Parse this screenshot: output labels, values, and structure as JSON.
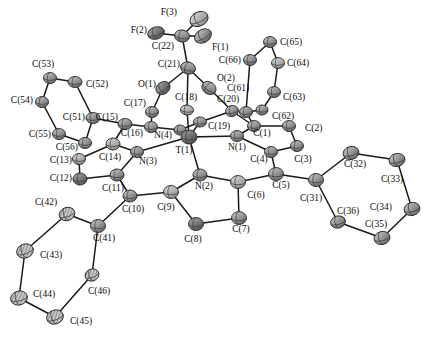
{
  "figure": {
    "kind": "ortep-thermal-ellipsoid-plot",
    "title": "",
    "background_color": "#ffffff",
    "bond_color": "#1a1a1a",
    "label_color": "#0d0d0d",
    "palette": {
      "carbon": "#8a8a8a",
      "carbon_dark": "#6e6e6e",
      "carbon_light": "#b4b4b4",
      "nitrogen": "#9c9c9c",
      "oxygen": "#7d7d7d",
      "fluorine": "#787878",
      "metal": "#6a6a6a",
      "outline": "#2a2a2a"
    }
  },
  "chart_data": {
    "type": "scatter",
    "title": "",
    "xlabel": "",
    "ylabel": "",
    "xlim": [
      0,
      439
    ],
    "ylim": [
      0,
      338
    ],
    "grid": false,
    "legend": "none",
    "atoms": [
      {
        "label": "F(3)",
        "element": "F",
        "x": 199,
        "y": 19,
        "rx": 9.5,
        "ry": 7.0,
        "rot": -25,
        "shade": "light",
        "lx": 177,
        "ly": 13,
        "anchor": "end"
      },
      {
        "label": "F(2)",
        "element": "F",
        "x": 156,
        "y": 33,
        "rx": 8.5,
        "ry": 6.0,
        "rot": -18,
        "shade": "dark",
        "lx": 147,
        "ly": 31,
        "anchor": "end"
      },
      {
        "label": "F(1)",
        "element": "F",
        "x": 203,
        "y": 36,
        "rx": 9.0,
        "ry": 6.5,
        "rot": -30,
        "shade": "mid",
        "lx": 212,
        "ly": 48,
        "anchor": "start"
      },
      {
        "label": "C(22)",
        "element": "C",
        "x": 182,
        "y": 36,
        "rx": 7.5,
        "ry": 6.0,
        "rot": 10,
        "shade": "mid",
        "lx": 174,
        "ly": 47,
        "anchor": "end"
      },
      {
        "label": "C(21)",
        "element": "C",
        "x": 188,
        "y": 68,
        "rx": 7.5,
        "ry": 6.0,
        "rot": 15,
        "shade": "mid",
        "lx": 180,
        "ly": 65,
        "anchor": "end"
      },
      {
        "label": "O(1)",
        "element": "O",
        "x": 163,
        "y": 88,
        "rx": 7.5,
        "ry": 6.0,
        "rot": -35,
        "shade": "dark",
        "lx": 156,
        "ly": 85,
        "anchor": "end"
      },
      {
        "label": "O(2)",
        "element": "O",
        "x": 209,
        "y": 88,
        "rx": 7.5,
        "ry": 6.0,
        "rot": 35,
        "shade": "mid",
        "lx": 217,
        "ly": 79,
        "anchor": "start"
      },
      {
        "label": "C(17)",
        "element": "C",
        "x": 152,
        "y": 112,
        "rx": 6.5,
        "ry": 5.5,
        "rot": 0,
        "shade": "mid",
        "lx": 146,
        "ly": 104,
        "anchor": "end"
      },
      {
        "label": "C(18)",
        "element": "C",
        "x": 187,
        "y": 110,
        "rx": 6.5,
        "ry": 5.0,
        "rot": 5,
        "shade": "light",
        "lx": 186,
        "ly": 98,
        "anchor": "middle"
      },
      {
        "label": "C(20)",
        "element": "C",
        "x": 232,
        "y": 111,
        "rx": 6.5,
        "ry": 5.5,
        "rot": -10,
        "shade": "mid",
        "lx": 228,
        "ly": 100,
        "anchor": "middle"
      },
      {
        "label": "C(16)",
        "element": "C",
        "x": 151,
        "y": 127,
        "rx": 6.5,
        "ry": 5.5,
        "rot": 0,
        "shade": "mid",
        "lx": 143,
        "ly": 134,
        "anchor": "end"
      },
      {
        "label": "C(19)",
        "element": "C",
        "x": 200,
        "y": 122,
        "rx": 6.5,
        "ry": 5.0,
        "rot": 0,
        "shade": "mid",
        "lx": 208,
        "ly": 127,
        "anchor": "start"
      },
      {
        "label": "N(4)",
        "element": "N",
        "x": 180,
        "y": 130,
        "rx": 6.0,
        "ry": 5.0,
        "rot": 0,
        "shade": "mid",
        "lx": 172,
        "ly": 136,
        "anchor": "end"
      },
      {
        "label": "T(1)",
        "element": "M",
        "x": 189,
        "y": 137,
        "rx": 8.0,
        "ry": 7.0,
        "rot": 0,
        "shade": "metal",
        "lx": 184,
        "ly": 151,
        "anchor": "middle"
      },
      {
        "label": "N(1)",
        "element": "N",
        "x": 237,
        "y": 136,
        "rx": 6.5,
        "ry": 5.5,
        "rot": 0,
        "shade": "mid",
        "lx": 228,
        "ly": 148,
        "anchor": "start"
      },
      {
        "label": "N(3)",
        "element": "N",
        "x": 137,
        "y": 152,
        "rx": 6.5,
        "ry": 5.5,
        "rot": 0,
        "shade": "mid",
        "lx": 148,
        "ly": 162,
        "anchor": "middle"
      },
      {
        "label": "N(2)",
        "element": "N",
        "x": 200,
        "y": 175,
        "rx": 7.0,
        "ry": 6.0,
        "rot": 0,
        "shade": "mid",
        "lx": 204,
        "ly": 187,
        "anchor": "middle"
      },
      {
        "label": "C(15)",
        "element": "C",
        "x": 125,
        "y": 124,
        "rx": 7.0,
        "ry": 5.5,
        "rot": 0,
        "shade": "mid",
        "lx": 118,
        "ly": 118,
        "anchor": "end"
      },
      {
        "label": "C(14)",
        "element": "C",
        "x": 113,
        "y": 144,
        "rx": 7.0,
        "ry": 6.0,
        "rot": 0,
        "shade": "light",
        "lx": 110,
        "ly": 158,
        "anchor": "middle"
      },
      {
        "label": "C(13)",
        "element": "C",
        "x": 79,
        "y": 159,
        "rx": 6.5,
        "ry": 5.5,
        "rot": 0,
        "shade": "light",
        "lx": 72,
        "ly": 161,
        "anchor": "end"
      },
      {
        "label": "C(12)",
        "element": "C",
        "x": 80,
        "y": 179,
        "rx": 7.0,
        "ry": 6.0,
        "rot": 0,
        "shade": "dark",
        "lx": 72,
        "ly": 179,
        "anchor": "end"
      },
      {
        "label": "C(11)",
        "element": "C",
        "x": 117,
        "y": 175,
        "rx": 7.0,
        "ry": 6.0,
        "rot": 0,
        "shade": "mid",
        "lx": 113,
        "ly": 189,
        "anchor": "middle"
      },
      {
        "label": "C(10)",
        "element": "C",
        "x": 130,
        "y": 196,
        "rx": 7.0,
        "ry": 6.0,
        "rot": 0,
        "shade": "mid",
        "lx": 133,
        "ly": 210,
        "anchor": "middle"
      },
      {
        "label": "C(9)",
        "element": "C",
        "x": 171,
        "y": 192,
        "rx": 7.5,
        "ry": 6.5,
        "rot": 0,
        "shade": "light",
        "lx": 166,
        "ly": 208,
        "anchor": "middle"
      },
      {
        "label": "C(8)",
        "element": "C",
        "x": 196,
        "y": 224,
        "rx": 7.5,
        "ry": 6.5,
        "rot": 0,
        "shade": "dark",
        "lx": 193,
        "ly": 240,
        "anchor": "middle"
      },
      {
        "label": "C(7)",
        "element": "C",
        "x": 239,
        "y": 218,
        "rx": 7.5,
        "ry": 6.5,
        "rot": 0,
        "shade": "mid",
        "lx": 241,
        "ly": 230,
        "anchor": "middle"
      },
      {
        "label": "C(6)",
        "element": "C",
        "x": 238,
        "y": 182,
        "rx": 7.5,
        "ry": 6.5,
        "rot": 0,
        "shade": "light",
        "lx": 256,
        "ly": 196,
        "anchor": "middle"
      },
      {
        "label": "C(5)",
        "element": "C",
        "x": 276,
        "y": 174,
        "rx": 7.5,
        "ry": 6.5,
        "rot": 0,
        "shade": "mid",
        "lx": 281,
        "ly": 186,
        "anchor": "middle"
      },
      {
        "label": "C(4)",
        "element": "C",
        "x": 271,
        "y": 152,
        "rx": 6.5,
        "ry": 5.5,
        "rot": 0,
        "shade": "mid",
        "lx": 259,
        "ly": 160,
        "anchor": "middle"
      },
      {
        "label": "C(3)",
        "element": "C",
        "x": 297,
        "y": 146,
        "rx": 6.5,
        "ry": 5.5,
        "rot": 0,
        "shade": "mid",
        "lx": 303,
        "ly": 160,
        "anchor": "middle"
      },
      {
        "label": "C(2)",
        "element": "C",
        "x": 289,
        "y": 126,
        "rx": 6.5,
        "ry": 5.5,
        "rot": 0,
        "shade": "mid",
        "lx": 305,
        "ly": 129,
        "anchor": "start"
      },
      {
        "label": "C(1)",
        "element": "C",
        "x": 254,
        "y": 126,
        "rx": 6.5,
        "ry": 5.5,
        "rot": 0,
        "shade": "mid",
        "lx": 262,
        "ly": 134,
        "anchor": "middle"
      },
      {
        "label": "C(61)",
        "element": "C",
        "x": 246,
        "y": 112,
        "rx": 6.5,
        "ry": 5.5,
        "rot": 0,
        "shade": "mid",
        "lx": 238,
        "ly": 89,
        "anchor": "middle"
      },
      {
        "label": "C(62)",
        "element": "C",
        "x": 262,
        "y": 110,
        "rx": 6.0,
        "ry": 5.0,
        "rot": 0,
        "shade": "mid",
        "lx": 272,
        "ly": 117,
        "anchor": "start"
      },
      {
        "label": "C(63)",
        "element": "C",
        "x": 274,
        "y": 92,
        "rx": 6.5,
        "ry": 5.5,
        "rot": 0,
        "shade": "mid",
        "lx": 283,
        "ly": 98,
        "anchor": "start"
      },
      {
        "label": "C(64)",
        "element": "C",
        "x": 278,
        "y": 63,
        "rx": 6.5,
        "ry": 5.5,
        "rot": 0,
        "shade": "light",
        "lx": 287,
        "ly": 64,
        "anchor": "start"
      },
      {
        "label": "C(65)",
        "element": "C",
        "x": 270,
        "y": 42,
        "rx": 6.5,
        "ry": 5.5,
        "rot": 0,
        "shade": "mid",
        "lx": 280,
        "ly": 43,
        "anchor": "start"
      },
      {
        "label": "C(66)",
        "element": "C",
        "x": 250,
        "y": 60,
        "rx": 6.5,
        "ry": 5.5,
        "rot": 0,
        "shade": "mid",
        "lx": 241,
        "ly": 61,
        "anchor": "end"
      },
      {
        "label": "C(51)",
        "element": "C",
        "x": 93,
        "y": 118,
        "rx": 7.0,
        "ry": 5.5,
        "rot": 0,
        "shade": "mid",
        "lx": 85,
        "ly": 118,
        "anchor": "end"
      },
      {
        "label": "C(52)",
        "element": "C",
        "x": 75,
        "y": 82,
        "rx": 7.0,
        "ry": 5.5,
        "rot": 0,
        "shade": "mid",
        "lx": 86,
        "ly": 85,
        "anchor": "start"
      },
      {
        "label": "C(53)",
        "element": "C",
        "x": 50,
        "y": 78,
        "rx": 6.5,
        "ry": 5.5,
        "rot": 0,
        "shade": "mid",
        "lx": 43,
        "ly": 65,
        "anchor": "middle"
      },
      {
        "label": "C(54)",
        "element": "C",
        "x": 42,
        "y": 102,
        "rx": 6.5,
        "ry": 5.5,
        "rot": 0,
        "shade": "mid",
        "lx": 33,
        "ly": 101,
        "anchor": "end"
      },
      {
        "label": "C(55)",
        "element": "C",
        "x": 59,
        "y": 134,
        "rx": 6.5,
        "ry": 5.5,
        "rot": 0,
        "shade": "mid",
        "lx": 51,
        "ly": 135,
        "anchor": "end"
      },
      {
        "label": "C(56)",
        "element": "C",
        "x": 85,
        "y": 143,
        "rx": 6.5,
        "ry": 5.5,
        "rot": 0,
        "shade": "mid",
        "lx": 78,
        "ly": 148,
        "anchor": "end"
      },
      {
        "label": "C(41)",
        "element": "C",
        "x": 98,
        "y": 226,
        "rx": 7.5,
        "ry": 6.5,
        "rot": 0,
        "shade": "mid",
        "lx": 104,
        "ly": 239,
        "anchor": "middle"
      },
      {
        "label": "C(42)",
        "element": "C",
        "x": 67,
        "y": 214,
        "rx": 8.0,
        "ry": 6.5,
        "rot": -20,
        "shade": "hatch",
        "lx": 46,
        "ly": 203,
        "anchor": "middle"
      },
      {
        "label": "C(43)",
        "element": "C",
        "x": 25,
        "y": 251,
        "rx": 8.5,
        "ry": 7.0,
        "rot": -20,
        "shade": "hatch",
        "lx": 40,
        "ly": 256,
        "anchor": "start"
      },
      {
        "label": "C(44)",
        "element": "C",
        "x": 19,
        "y": 298,
        "rx": 8.5,
        "ry": 7.0,
        "rot": -15,
        "shade": "hatch",
        "lx": 33,
        "ly": 295,
        "anchor": "start"
      },
      {
        "label": "C(45)",
        "element": "C",
        "x": 55,
        "y": 317,
        "rx": 8.5,
        "ry": 7.0,
        "rot": -20,
        "shade": "hatch",
        "lx": 70,
        "ly": 322,
        "anchor": "start"
      },
      {
        "label": "C(46)",
        "element": "C",
        "x": 92,
        "y": 275,
        "rx": 7.0,
        "ry": 6.0,
        "rot": -20,
        "shade": "hatch",
        "lx": 99,
        "ly": 292,
        "anchor": "middle"
      },
      {
        "label": "C(31)",
        "element": "C",
        "x": 316,
        "y": 180,
        "rx": 7.5,
        "ry": 6.5,
        "rot": 0,
        "shade": "mid",
        "lx": 311,
        "ly": 199,
        "anchor": "middle"
      },
      {
        "label": "C(32)",
        "element": "C",
        "x": 351,
        "y": 153,
        "rx": 8.0,
        "ry": 6.5,
        "rot": -15,
        "shade": "mid",
        "lx": 355,
        "ly": 165,
        "anchor": "middle"
      },
      {
        "label": "C(33)",
        "element": "C",
        "x": 397,
        "y": 160,
        "rx": 8.0,
        "ry": 6.5,
        "rot": -15,
        "shade": "mid",
        "lx": 392,
        "ly": 180,
        "anchor": "middle"
      },
      {
        "label": "C(34)",
        "element": "C",
        "x": 412,
        "y": 209,
        "rx": 8.0,
        "ry": 6.5,
        "rot": -15,
        "shade": "mid",
        "lx": 392,
        "ly": 208,
        "anchor": "end"
      },
      {
        "label": "C(35)",
        "element": "C",
        "x": 382,
        "y": 238,
        "rx": 8.0,
        "ry": 6.5,
        "rot": -15,
        "shade": "mid",
        "lx": 376,
        "ly": 225,
        "anchor": "middle"
      },
      {
        "label": "C(36)",
        "element": "C",
        "x": 338,
        "y": 222,
        "rx": 7.5,
        "ry": 6.0,
        "rot": -15,
        "shade": "mid",
        "lx": 348,
        "ly": 212,
        "anchor": "middle"
      }
    ],
    "bonds": [
      [
        "F(3)",
        "C(22)"
      ],
      [
        "F(2)",
        "C(22)"
      ],
      [
        "F(1)",
        "C(22)"
      ],
      [
        "C(22)",
        "C(21)"
      ],
      [
        "C(21)",
        "O(1)"
      ],
      [
        "C(21)",
        "O(2)"
      ],
      [
        "O(1)",
        "C(17)"
      ],
      [
        "O(2)",
        "C(20)"
      ],
      [
        "C(17)",
        "C(16)"
      ],
      [
        "C(20)",
        "C(19)"
      ],
      [
        "C(21)",
        "C(18)"
      ],
      [
        "C(18)",
        "T(1)"
      ],
      [
        "C(16)",
        "N(4)"
      ],
      [
        "C(19)",
        "N(4)"
      ],
      [
        "N(4)",
        "T(1)"
      ],
      [
        "C(19)",
        "T(1)"
      ],
      [
        "T(1)",
        "N(1)"
      ],
      [
        "T(1)",
        "N(3)"
      ],
      [
        "T(1)",
        "N(2)"
      ],
      [
        "C(15)",
        "C(16)"
      ],
      [
        "C(15)",
        "C(14)"
      ],
      [
        "C(14)",
        "N(3)"
      ],
      [
        "C(14)",
        "C(13)"
      ],
      [
        "C(13)",
        "C(12)"
      ],
      [
        "C(12)",
        "C(11)"
      ],
      [
        "C(11)",
        "N(3)"
      ],
      [
        "C(11)",
        "C(10)"
      ],
      [
        "C(10)",
        "C(9)"
      ],
      [
        "C(9)",
        "N(2)"
      ],
      [
        "C(9)",
        "C(8)"
      ],
      [
        "C(8)",
        "C(7)"
      ],
      [
        "C(7)",
        "C(6)"
      ],
      [
        "C(6)",
        "N(2)"
      ],
      [
        "C(6)",
        "C(5)"
      ],
      [
        "C(5)",
        "C(4)"
      ],
      [
        "C(4)",
        "N(1)"
      ],
      [
        "C(4)",
        "C(3)"
      ],
      [
        "C(3)",
        "C(2)"
      ],
      [
        "C(2)",
        "C(1)"
      ],
      [
        "C(1)",
        "N(1)"
      ],
      [
        "C(1)",
        "C(20)"
      ],
      [
        "C(1)",
        "C(61)"
      ],
      [
        "C(61)",
        "C(62)"
      ],
      [
        "C(62)",
        "C(63)"
      ],
      [
        "C(63)",
        "C(64)"
      ],
      [
        "C(64)",
        "C(65)"
      ],
      [
        "C(65)",
        "C(66)"
      ],
      [
        "C(66)",
        "C(61)"
      ],
      [
        "C(15)",
        "C(51)"
      ],
      [
        "C(51)",
        "C(52)"
      ],
      [
        "C(52)",
        "C(53)"
      ],
      [
        "C(53)",
        "C(54)"
      ],
      [
        "C(54)",
        "C(55)"
      ],
      [
        "C(55)",
        "C(56)"
      ],
      [
        "C(56)",
        "C(51)"
      ],
      [
        "C(10)",
        "C(41)"
      ],
      [
        "C(41)",
        "C(42)"
      ],
      [
        "C(42)",
        "C(43)"
      ],
      [
        "C(43)",
        "C(44)"
      ],
      [
        "C(44)",
        "C(45)"
      ],
      [
        "C(45)",
        "C(46)"
      ],
      [
        "C(46)",
        "C(41)"
      ],
      [
        "C(5)",
        "C(31)"
      ],
      [
        "C(31)",
        "C(32)"
      ],
      [
        "C(32)",
        "C(33)"
      ],
      [
        "C(33)",
        "C(34)"
      ],
      [
        "C(34)",
        "C(35)"
      ],
      [
        "C(35)",
        "C(36)"
      ],
      [
        "C(36)",
        "C(31)"
      ]
    ]
  }
}
